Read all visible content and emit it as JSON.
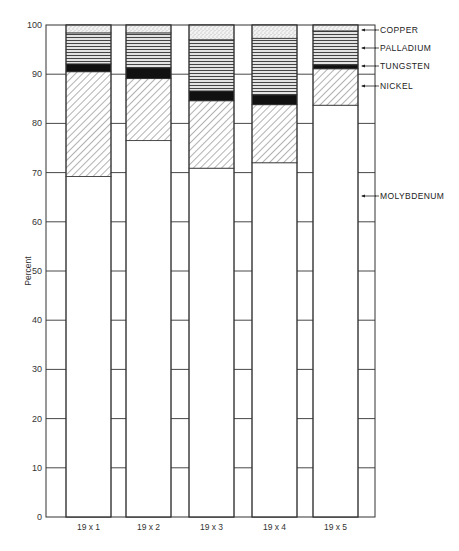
{
  "chart_data": {
    "type": "bar",
    "stacked": true,
    "title": "",
    "xlabel": "",
    "ylabel": "Percent",
    "ylim": [
      0,
      100
    ],
    "yticks": [
      0,
      10,
      20,
      30,
      40,
      50,
      60,
      70,
      80,
      90,
      100
    ],
    "grid": "horizontal ticks between bars",
    "legend_position": "right, labels with arrows",
    "categories": [
      "19 x 1",
      "19 x 2",
      "19 x 3",
      "19 x 4",
      "19 x 5"
    ],
    "series": [
      {
        "name": "MOLYBDENUM",
        "pattern": "blank",
        "values": [
          69.2,
          76.5,
          70.9,
          72.0,
          83.7
        ]
      },
      {
        "name": "NICKEL",
        "pattern": "diagonal-hatch",
        "values": [
          21.3,
          12.6,
          13.7,
          11.8,
          7.4
        ]
      },
      {
        "name": "TUNGSTEN",
        "pattern": "solid-black",
        "values": [
          1.6,
          2.2,
          2.0,
          2.0,
          0.8
        ]
      },
      {
        "name": "PALLADIUM",
        "pattern": "horizontal-lines",
        "values": [
          6.3,
          7.1,
          10.4,
          11.5,
          6.9
        ]
      },
      {
        "name": "COPPER",
        "pattern": "stipple",
        "values": [
          1.6,
          1.6,
          3.0,
          2.7,
          1.2
        ]
      }
    ],
    "cumulative_tops": {
      "MOLYBDENUM": [
        69.2,
        76.5,
        70.9,
        72.0,
        83.7
      ],
      "NICKEL": [
        90.5,
        89.1,
        84.6,
        83.8,
        91.1
      ],
      "TUNGSTEN": [
        92.1,
        91.3,
        86.6,
        85.8,
        91.9
      ],
      "PALLADIUM": [
        98.4,
        98.4,
        97.0,
        97.3,
        98.8
      ],
      "COPPER": [
        100,
        100,
        100,
        100,
        100
      ]
    }
  },
  "legend": [
    {
      "label": "COPPER",
      "y": 30
    },
    {
      "label": "PALLADIUM",
      "y": 48
    },
    {
      "label": "TUNGSTEN",
      "y": 66
    },
    {
      "label": "NICKEL",
      "y": 86
    },
    {
      "label": "MOLYBDENUM",
      "y": 196
    }
  ],
  "axis": {
    "ylabel": "Percent",
    "yticks": [
      "0",
      "10",
      "20",
      "30",
      "40",
      "50",
      "60",
      "70",
      "80",
      "90",
      "100"
    ]
  }
}
